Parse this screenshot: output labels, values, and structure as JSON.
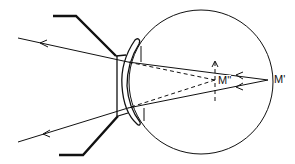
{
  "diagram": {
    "type": "optics-eye-lens-ray-diagram",
    "labels": {
      "far_point": "M'",
      "virtual_image": "M''"
    },
    "elements": {
      "eye": "circle",
      "spectacle_frame": "frame-lines",
      "lens": "concave-lens",
      "rays": [
        "upper-ray",
        "lower-ray"
      ],
      "virtual_rays": [
        "upper-dashed-ray",
        "lower-dashed-ray"
      ],
      "image_marker": "dashed-vertical-arrow"
    },
    "colors": {
      "stroke": "#111111",
      "background": "#ffffff"
    }
  }
}
